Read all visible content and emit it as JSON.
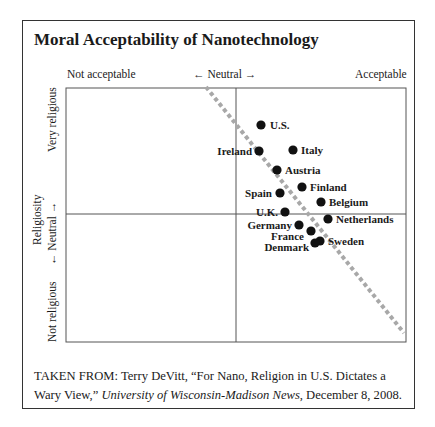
{
  "chart_data": {
    "type": "scatter",
    "title": "Moral Acceptability of Nanotechnology",
    "xlabel": "Moral acceptability",
    "x_ticks": [
      "Not acceptable",
      "Neutral",
      "Acceptable"
    ],
    "ylabel": "Religiosity",
    "y_ticks": [
      "Not religious",
      "Neutral",
      "Very religious"
    ],
    "xlim": [
      -1,
      1
    ],
    "ylim": [
      -1,
      1
    ],
    "grid": false,
    "quadrant_lines": true,
    "trend_line": {
      "style": "dashed",
      "from": [
        -0.17,
        1.0
      ],
      "to": [
        0.99,
        -0.9
      ]
    },
    "points": [
      {
        "label": "U.S.",
        "x": 0.15,
        "y": 0.71,
        "px": 261,
        "py": 125,
        "lx": 270,
        "ly": 129,
        "anchor": "start"
      },
      {
        "label": "Ireland",
        "x": 0.14,
        "y": 0.49,
        "px": 259,
        "py": 151,
        "lx": 252,
        "ly": 155,
        "anchor": "end"
      },
      {
        "label": "Italy",
        "x": 0.34,
        "y": 0.5,
        "px": 293,
        "py": 150,
        "lx": 301,
        "ly": 154,
        "anchor": "start"
      },
      {
        "label": "Austria",
        "x": 0.24,
        "y": 0.33,
        "px": 277,
        "py": 170,
        "lx": 285,
        "ly": 174,
        "anchor": "start"
      },
      {
        "label": "Finland",
        "x": 0.39,
        "y": 0.18,
        "px": 302,
        "py": 187,
        "lx": 310,
        "ly": 191,
        "anchor": "start"
      },
      {
        "label": "Spain",
        "x": 0.26,
        "y": 0.17,
        "px": 280,
        "py": 193,
        "lx": 272,
        "ly": 197,
        "anchor": "end"
      },
      {
        "label": "Belgium",
        "x": 0.5,
        "y": 0.1,
        "px": 321,
        "py": 202,
        "lx": 329,
        "ly": 206,
        "anchor": "start"
      },
      {
        "label": "U.K.",
        "x": 0.29,
        "y": 0.02,
        "px": 285,
        "py": 212,
        "lx": 278,
        "ly": 216,
        "anchor": "end"
      },
      {
        "label": "Netherlands",
        "x": 0.54,
        "y": -0.04,
        "px": 328,
        "py": 219,
        "lx": 336,
        "ly": 223,
        "anchor": "start"
      },
      {
        "label": "Germany",
        "x": 0.37,
        "y": -0.09,
        "px": 299,
        "py": 225,
        "lx": 292,
        "ly": 229,
        "anchor": "end"
      },
      {
        "label": "France",
        "x": 0.44,
        "y": -0.14,
        "px": 311,
        "py": 231,
        "lx": 304,
        "ly": 240,
        "anchor": "end"
      },
      {
        "label": "Sweden",
        "x": 0.49,
        "y": -0.23,
        "px": 320,
        "py": 241,
        "lx": 328,
        "ly": 245,
        "anchor": "start"
      },
      {
        "label": "Denmark",
        "x": 0.46,
        "y": -0.25,
        "px": 315,
        "py": 243,
        "lx": 309,
        "ly": 251,
        "anchor": "end"
      }
    ]
  },
  "title": "Moral Acceptability of Nanotechnology",
  "axes": {
    "x_left": "Not acceptable",
    "x_mid": "← Neutral →",
    "x_right": "Acceptable",
    "y_top": "Very religious",
    "y_mid": "← Neutral →",
    "y_bottom": "Not religious",
    "y_title": "Religiosity"
  },
  "caption": {
    "prefix": "TAKEN FROM: Terry DeVitt, “For Nano, Religion in U.S. Dictates a Wary View,” ",
    "italic": "University of Wisconsin-Madison News",
    "suffix": ", December 8, 2008."
  }
}
